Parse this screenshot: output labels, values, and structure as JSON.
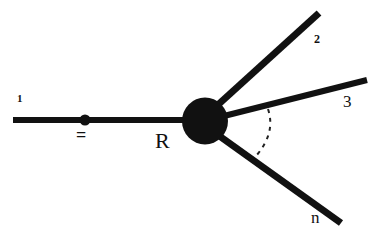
{
  "figure": {
    "kind": "feynman-diagram",
    "background_color": "#ffffff",
    "ink_color": "#111111",
    "width": 373,
    "height": 241
  },
  "labels": {
    "incoming_line": "1",
    "equals_sign": "=",
    "vertex_blob": "R",
    "outgoing_top": "2",
    "outgoing_middle": "3",
    "outgoing_bottom": "n"
  },
  "elements": {
    "incoming_line_name": "incoming-particle-line",
    "propagator_dot_name": "propagator-dot",
    "vertex_blob_name": "interaction-blob",
    "outgoing_top_name": "outgoing-line-2",
    "outgoing_middle_name": "outgoing-line-3",
    "outgoing_bottom_name": "outgoing-line-n",
    "ellipsis_arc_name": "dashed-ellipsis-arc"
  },
  "geometry": {
    "incoming_line": {
      "x1": 13,
      "y1": 120,
      "x2": 190,
      "y2": 120,
      "stroke_width": 6
    },
    "propagator_dot": {
      "cx": 85,
      "cy": 120,
      "r": 5.5
    },
    "vertex_blob": {
      "cx": 205,
      "cy": 121,
      "rx": 23,
      "ry": 23.5
    },
    "outgoing_top": {
      "x1": 212,
      "y1": 110,
      "x2": 319,
      "y2": 13,
      "stroke_width": 7
    },
    "outgoing_middle": {
      "x1": 215,
      "y1": 118,
      "x2": 367,
      "y2": 80,
      "stroke_width": 6
    },
    "outgoing_bottom": {
      "x1": 214,
      "y1": 132,
      "x2": 341,
      "y2": 223,
      "stroke_width": 7
    },
    "ellipsis_arc": {
      "start_x": 268,
      "start_y": 109,
      "ctrl_x": 275,
      "ctrl_y": 133,
      "end_x": 256,
      "end_y": 156,
      "stroke_width": 2,
      "dash": "4 5"
    }
  }
}
